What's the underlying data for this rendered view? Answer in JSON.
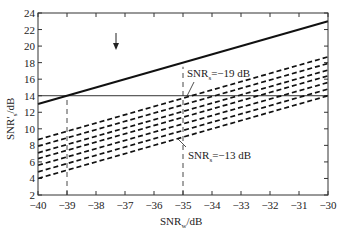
{
  "chart_data": {
    "type": "line",
    "title": "",
    "xlabel": "SNR_w/dB",
    "ylabel": "SNR'_s/dB",
    "xlim": [
      -40,
      -30
    ],
    "ylim": [
      2,
      24
    ],
    "xticks": [
      -40,
      -39,
      -38,
      -37,
      -36,
      -35,
      -34,
      -33,
      -32,
      -31,
      -30
    ],
    "yticks": [
      2,
      4,
      6,
      8,
      10,
      12,
      14,
      16,
      18,
      20,
      22,
      24
    ],
    "grid": false,
    "series": [
      {
        "name": "solid",
        "style": "solid",
        "x": [
          -40,
          -30
        ],
        "y": [
          13.0,
          23.0
        ]
      },
      {
        "name": "SNR_s=-19 dB",
        "style": "dashed",
        "x": [
          -40,
          -30
        ],
        "y": [
          8.7,
          18.7
        ]
      },
      {
        "name": "SNR_s=-18 dB",
        "style": "dashed",
        "x": [
          -40,
          -30
        ],
        "y": [
          7.9,
          17.9
        ]
      },
      {
        "name": "SNR_s=-17 dB",
        "style": "dashed",
        "x": [
          -40,
          -30
        ],
        "y": [
          7.1,
          17.1
        ]
      },
      {
        "name": "SNR_s=-16 dB",
        "style": "dashed",
        "x": [
          -40,
          -30
        ],
        "y": [
          6.4,
          16.4
        ]
      },
      {
        "name": "SNR_s=-15 dB",
        "style": "dashed",
        "x": [
          -40,
          -30
        ],
        "y": [
          5.6,
          15.6
        ]
      },
      {
        "name": "SNR_s=-14 dB",
        "style": "dashed",
        "x": [
          -40,
          -30
        ],
        "y": [
          4.8,
          14.8
        ]
      },
      {
        "name": "SNR_s=-13 dB",
        "style": "dashed",
        "x": [
          -40,
          -30
        ],
        "y": [
          4.0,
          14.0
        ]
      }
    ],
    "reference_lines": [
      {
        "type": "horizontal",
        "y": 14,
        "style": "solid-thin"
      },
      {
        "type": "vertical",
        "x": -39,
        "style": "dashed",
        "y_range": [
          2,
          14
        ]
      },
      {
        "type": "vertical",
        "x": -35,
        "style": "dashed",
        "y_range": [
          2,
          17.5
        ]
      }
    ],
    "annotations": [
      {
        "text": "SNR_s=-19 dB",
        "x": -35,
        "y": 16.3
      },
      {
        "text": "SNR_s=-13 dB",
        "x": -35,
        "y": 7.0
      },
      {
        "type": "arrow",
        "x": -37.3,
        "y_from": 18.5,
        "y_to": 16.2
      }
    ]
  },
  "labels": {
    "xlabel_main": "SNR",
    "xlabel_sub": "w",
    "xlabel_unit": "/dB",
    "ylabel_main": "SNR",
    "ylabel_prime": "′",
    "ylabel_sub": "s",
    "ylabel_unit": "/dB",
    "ann_top_main": "SNR",
    "ann_top_sub": "s",
    "ann_top_val": "=−19 dB",
    "ann_bot_main": "SNR",
    "ann_bot_sub": "s",
    "ann_bot_val": "=−13 dB"
  }
}
